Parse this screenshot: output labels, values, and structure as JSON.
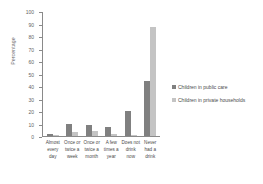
{
  "chart_data": {
    "type": "bar",
    "title": "",
    "xlabel": "",
    "ylabel": "Percentage",
    "ylim": [
      0,
      100
    ],
    "yticks": [
      0,
      10,
      20,
      30,
      40,
      50,
      60,
      70,
      80,
      90,
      100
    ],
    "grid": false,
    "legend_position": "right",
    "categories": [
      "Almost every day",
      "Once or twice a week",
      "Once or twice a month",
      "A few times a year",
      "Does not drink now",
      "Never had a drink"
    ],
    "series": [
      {
        "name": "Children in public care",
        "color": "#808080",
        "values": [
          2,
          10,
          9,
          7,
          20,
          44
        ]
      },
      {
        "name": "Children in private households",
        "color": "#c4c4c4",
        "values": [
          1,
          3,
          4,
          2,
          1,
          87
        ]
      }
    ]
  },
  "axis": {
    "y_title": "Percentage"
  }
}
